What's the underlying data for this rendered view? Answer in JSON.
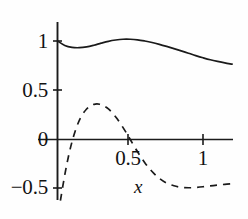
{
  "chart_data": {
    "type": "line",
    "title": "",
    "xlabel": "x",
    "ylabel": "",
    "xlim": [
      -0.03,
      1.22
    ],
    "ylim": [
      -0.62,
      1.12
    ],
    "grid": false,
    "legend": "none",
    "axis_style": "two-axis-cross",
    "x_ticks": [
      {
        "value": 0.5,
        "label": "0.5"
      },
      {
        "value": 1,
        "label": "1"
      }
    ],
    "y_ticks": [
      {
        "value": -0.5,
        "label": "−0.5"
      },
      {
        "value": 0,
        "label": "0"
      },
      {
        "value": 0.5,
        "label": "0.5"
      },
      {
        "value": 1,
        "label": "1"
      }
    ],
    "series": [
      {
        "name": "solid-curve",
        "style": "solid",
        "color": "#1a1a1a",
        "x": [
          0.0,
          0.05,
          0.1,
          0.15,
          0.2,
          0.25,
          0.3,
          0.35,
          0.4,
          0.45,
          0.5,
          0.55,
          0.6,
          0.65,
          0.7,
          0.75,
          0.8,
          0.85,
          0.9,
          0.95,
          1.0,
          1.05,
          1.1,
          1.15,
          1.2
        ],
        "y": [
          1.0,
          0.955,
          0.935,
          0.932,
          0.94,
          0.957,
          0.978,
          0.997,
          1.01,
          1.018,
          1.018,
          1.012,
          1.0,
          0.985,
          0.966,
          0.945,
          0.923,
          0.9,
          0.876,
          0.852,
          0.83,
          0.81,
          0.793,
          0.778,
          0.765
        ]
      },
      {
        "name": "dashed-curve",
        "style": "dashed",
        "color": "#1a1a1a",
        "x": [
          0.02,
          0.05,
          0.08,
          0.11,
          0.14,
          0.17,
          0.2,
          0.23,
          0.26,
          0.29,
          0.32,
          0.35,
          0.38,
          0.41,
          0.44,
          0.47,
          0.5,
          0.55,
          0.6,
          0.65,
          0.7,
          0.75,
          0.8,
          0.85,
          0.9,
          0.95,
          1.0,
          1.05,
          1.1,
          1.15,
          1.2
        ],
        "y": [
          -0.62,
          -0.36,
          -0.14,
          0.03,
          0.16,
          0.25,
          0.31,
          0.345,
          0.36,
          0.358,
          0.34,
          0.31,
          0.265,
          0.21,
          0.145,
          0.075,
          0.0,
          -0.125,
          -0.235,
          -0.325,
          -0.395,
          -0.443,
          -0.47,
          -0.485,
          -0.49,
          -0.487,
          -0.48,
          -0.47,
          -0.462,
          -0.455,
          -0.45
        ]
      }
    ]
  }
}
